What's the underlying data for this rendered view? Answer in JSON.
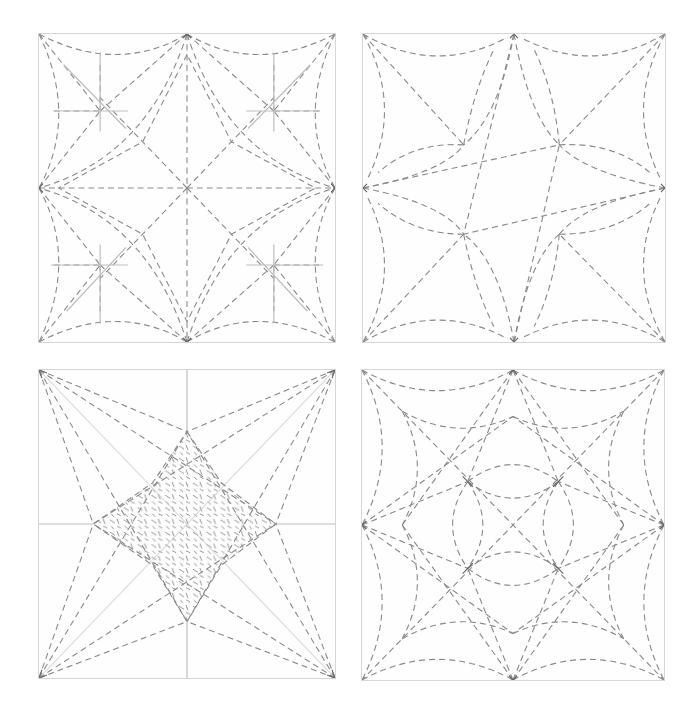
{
  "figure": {
    "panels": [
      {
        "id": "top-left",
        "position": "row1-col1",
        "pattern": "eight-point star with center cross, diagonals, concave arcs and four corner solid-line crosses"
      },
      {
        "id": "top-right",
        "position": "row1-col2",
        "pattern": "four-point star formed by curved petals meeting at edge midpoints"
      },
      {
        "id": "bottom-left",
        "position": "row2-col1",
        "pattern": "eight-point star with stippled (hatched) center diamond and straight dashed rays to corners"
      },
      {
        "id": "bottom-right",
        "position": "row2-col2",
        "pattern": "spiderweb-like pattern with concentric concave arcs, diagonals and central lens shapes"
      }
    ],
    "colors": {
      "background": "#ffffff",
      "border": "#d6d6d6",
      "dashed_line": "#8a8a8a",
      "solid_guide_line": "#bdbdbd"
    }
  }
}
